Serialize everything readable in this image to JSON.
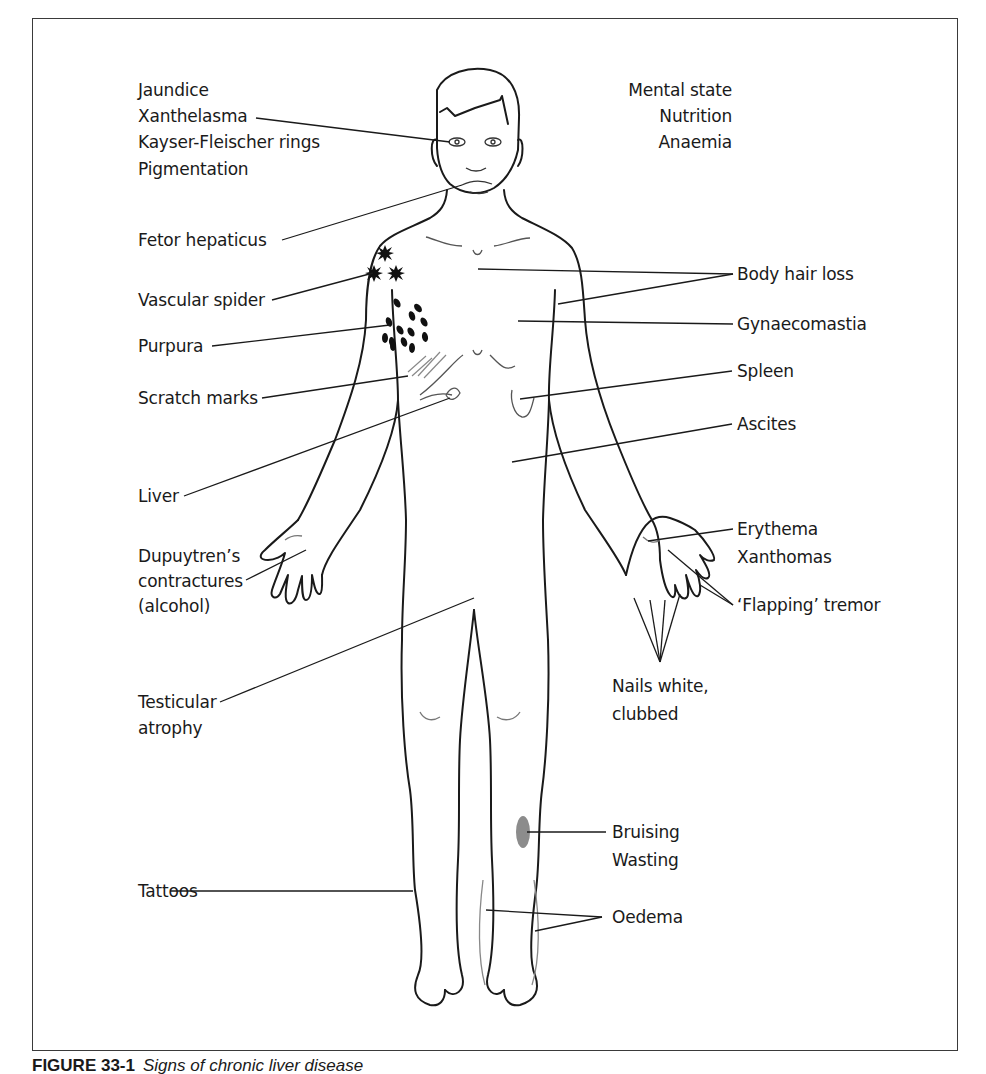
{
  "figure": {
    "caption_number": "FIGURE 33-1",
    "caption_text": "Signs of chronic liver disease"
  },
  "labels": {
    "head_left": [
      "Jaundice",
      "Xanthelasma",
      "Kayser-Fleischer rings",
      "Pigmentation"
    ],
    "head_right": [
      "Mental state",
      "Nutrition",
      "Anaemia"
    ],
    "fetor": "Fetor hepaticus",
    "vascular_spider": "Vascular spider",
    "purpura": "Purpura",
    "scratch_marks": "Scratch marks",
    "liver": "Liver",
    "dupuytren": [
      "Dupuytren’s",
      "contractures",
      "(alcohol)"
    ],
    "testicular": [
      "Testicular",
      "atrophy"
    ],
    "tattoos": "Tattoos",
    "body_hair_loss": "Body hair loss",
    "gynaecomastia": "Gynaecomastia",
    "spleen": "Spleen",
    "ascites": "Ascites",
    "erythema": [
      "Erythema",
      "Xanthomas"
    ],
    "flapping": "‘Flapping’ tremor",
    "nails": [
      "Nails white,",
      "clubbed"
    ],
    "bruising": [
      "Bruising",
      "Wasting"
    ],
    "oedema": "Oedema"
  },
  "colors": {
    "line": "#1a1a1a",
    "bruise": "#8c8c8c",
    "frame": "#3a3a3a"
  }
}
